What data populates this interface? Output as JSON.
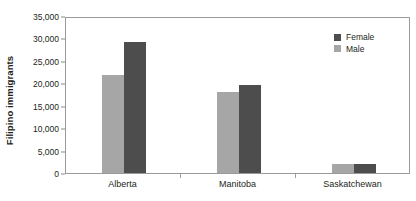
{
  "chart_data": {
    "type": "bar",
    "title": "",
    "xlabel": "",
    "ylabel": "Filipino immigrants",
    "categories": [
      "Alberta",
      "Manitoba",
      "Saskatchewan"
    ],
    "series": [
      {
        "name": "Female",
        "color": "#4d4d4d",
        "values": [
          29200,
          19700,
          2100
        ]
      },
      {
        "name": "Male",
        "color": "#a6a6a6",
        "values": [
          21800,
          18000,
          1900
        ]
      }
    ],
    "series_plot_order": [
      "Male",
      "Female"
    ],
    "ylim": [
      0,
      35000
    ],
    "yticks": [
      0,
      5000,
      10000,
      15000,
      20000,
      25000,
      30000,
      35000
    ],
    "ytick_labels": [
      "0",
      "5,000",
      "10,000",
      "15,000",
      "20,000",
      "25,000",
      "30,000",
      "35,000"
    ],
    "grid": false,
    "legend_position": "top-right",
    "frame": true
  },
  "legend": {
    "items": [
      {
        "label": "Female",
        "color": "#4d4d4d"
      },
      {
        "label": "Male",
        "color": "#a6a6a6"
      }
    ]
  }
}
